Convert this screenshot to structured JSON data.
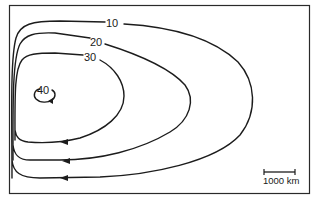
{
  "figure": {
    "type": "streamfunction contour diagram",
    "contours": [
      {
        "level": 10,
        "label": "10"
      },
      {
        "level": 20,
        "label": "20"
      },
      {
        "level": 30,
        "label": "30"
      },
      {
        "level": 40,
        "label": "40"
      }
    ],
    "scale_bar": {
      "label": "1000 km",
      "length_px": 32
    },
    "colors": {
      "line": "#1c1c1c",
      "background": "#ffffff",
      "frame": "#2a2a2a"
    },
    "flow_direction": "westward along southern branches (arrows point left)"
  }
}
